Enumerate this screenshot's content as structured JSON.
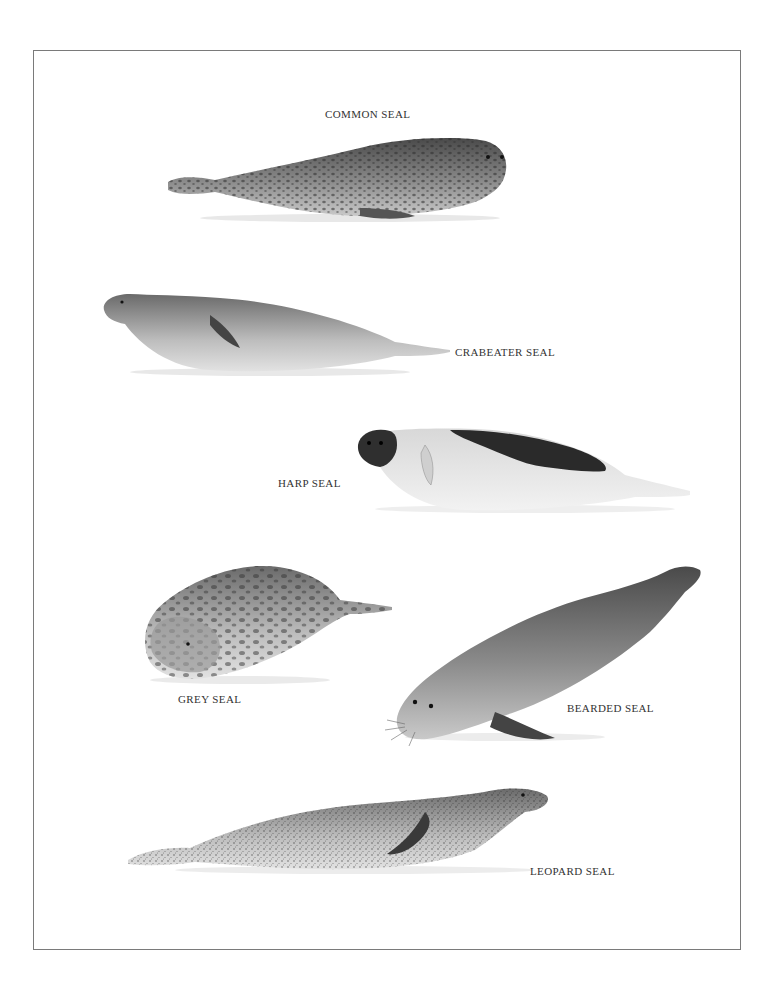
{
  "plate": {
    "border_color": "#7a7a7a",
    "background": "#ffffff"
  },
  "seals": [
    {
      "name": "Common Seal",
      "label": "COMMON SEAL"
    },
    {
      "name": "Crabeater Seal",
      "label": "CRABEATER SEAL"
    },
    {
      "name": "Harp Seal",
      "label": "HARP SEAL"
    },
    {
      "name": "Grey Seal",
      "label": "GREY SEAL"
    },
    {
      "name": "Bearded Seal",
      "label": "BEARDED SEAL"
    },
    {
      "name": "Leopard Seal",
      "label": "LEOPARD SEAL"
    }
  ]
}
